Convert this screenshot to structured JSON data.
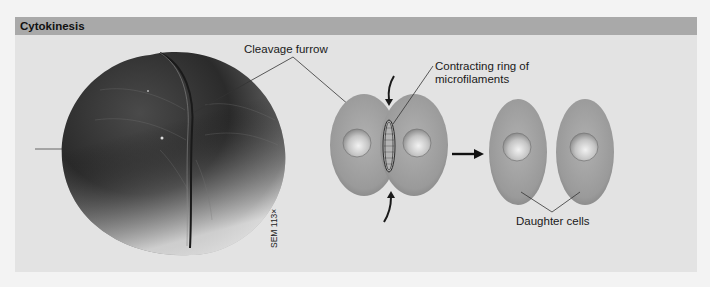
{
  "panel": {
    "title": "Cytokinesis",
    "header_color": "#a9a9a9",
    "background_color": "#e3e3e3"
  },
  "micrograph": {
    "caption": "SEM 113×",
    "description": "Scanning electron micrograph of a dividing cell showing cleavage furrow"
  },
  "labels": {
    "cleavage_furrow": "Cleavage furrow",
    "contracting_ring": "Contracting ring of microfilaments",
    "daughter_cells": "Daughter cells"
  },
  "diagram": {
    "stages": [
      "Dividing cell with contracting ring",
      "Two daughter cells"
    ],
    "cell_color": "#9c9c9c",
    "nucleus_color": "#bdbdbd",
    "arrow_color": "#1a1a1a"
  }
}
